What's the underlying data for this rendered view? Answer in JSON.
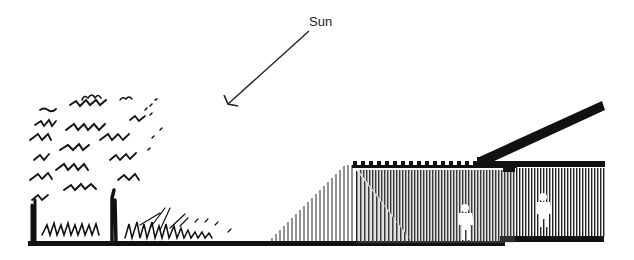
{
  "diagram": {
    "type": "architectural-section",
    "labels": {
      "sun": "Sun"
    },
    "elements": [
      {
        "id": "sun-arrow",
        "description": "arrow indicating direction of sunlight, from upper right toward lower left"
      },
      {
        "id": "trees",
        "description": "sketched trees and shrubs on the left"
      },
      {
        "id": "ground-line",
        "description": "heavy ground line across the section"
      },
      {
        "id": "sunlight-rays",
        "description": "vertical hatch lines rising diagonally representing sun penetration"
      },
      {
        "id": "building",
        "description": "building section with roof beams, shaded interior, two human figures"
      },
      {
        "id": "sloped-roof",
        "description": "angled roof overhang / clerestory on the right"
      },
      {
        "id": "figure-left",
        "description": "human figure silhouette in lower floor area"
      },
      {
        "id": "figure-right",
        "description": "human figure silhouette in raised floor area"
      }
    ],
    "colors": {
      "ink": "#111111",
      "background": "#ffffff",
      "shade": "#555555"
    }
  }
}
